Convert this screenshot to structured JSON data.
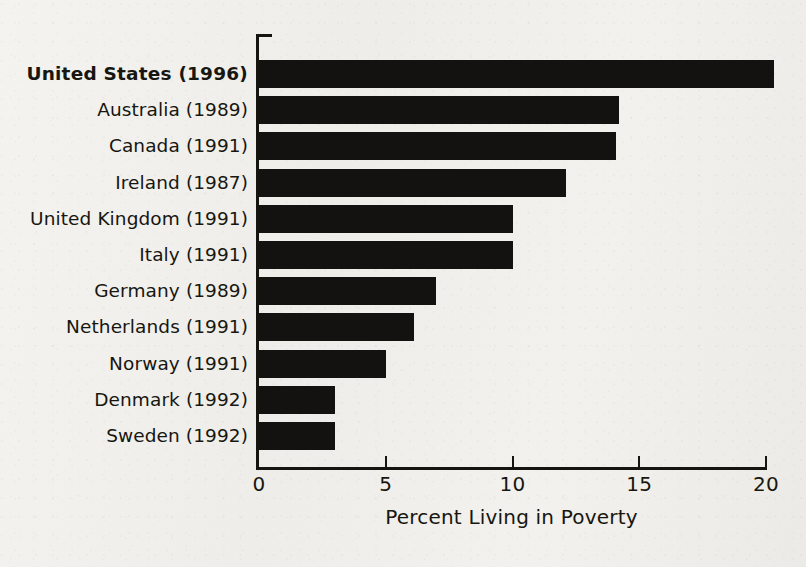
{
  "chart_data": {
    "type": "bar",
    "orientation": "horizontal",
    "title": "",
    "xlabel": "Percent Living in Poverty",
    "ylabel": "",
    "xlim": [
      0,
      20
    ],
    "xticks": [
      0,
      5,
      10,
      15,
      20
    ],
    "xtick_labels": [
      "0",
      "5",
      "10",
      "15",
      "20"
    ],
    "grid": false,
    "legend": null,
    "bar_color": "#131210",
    "background_color": "#f1f0ed",
    "categories": [
      "United States (1996)",
      "Australia (1989)",
      "Canada (1991)",
      "Ireland (1987)",
      "United Kingdom (1991)",
      "Italy (1991)",
      "Germany (1989)",
      "Netherlands (1991)",
      "Norway (1991)",
      "Denmark (1992)",
      "Sweden (1992)"
    ],
    "values": [
      20.3,
      14.2,
      14.1,
      12.1,
      10.0,
      10.0,
      7.0,
      6.1,
      5.0,
      3.0,
      3.0
    ],
    "highlight_category": "United States (1996)"
  }
}
